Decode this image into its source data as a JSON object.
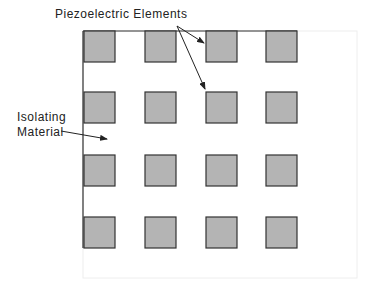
{
  "labels": {
    "piezo": "Piezoelectric  Elements",
    "isolating_line1": "Isolating",
    "isolating_line2": "Material"
  },
  "grid": {
    "rows": 4,
    "cols": 4
  },
  "colors": {
    "element_fill": "#b4b4b4",
    "element_stroke": "#333333",
    "line": "#333333"
  }
}
